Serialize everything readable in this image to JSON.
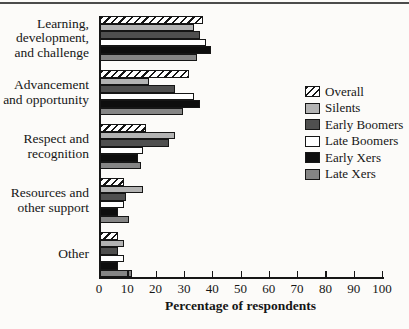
{
  "chart_data": {
    "type": "bar",
    "orientation": "horizontal",
    "title": "",
    "xlabel": "Percentage of respondents",
    "ylabel": "",
    "xlim": [
      0,
      100
    ],
    "xticks": [
      0,
      10,
      20,
      30,
      40,
      50,
      60,
      70,
      80,
      90,
      100
    ],
    "grid": false,
    "legend_position": "right",
    "categories": [
      "Learning, development, and challenge",
      "Advancement and opportunity",
      "Respect and recognition",
      "Resources and other support",
      "Other"
    ],
    "category_label_lines": [
      [
        "Learning,",
        "development,",
        "and challenge"
      ],
      [
        "Advancement",
        "and opportunity"
      ],
      [
        "Respect and",
        "recognition"
      ],
      [
        "Resources and",
        "other support"
      ],
      [
        "Other"
      ]
    ],
    "series": [
      {
        "name": "Overall",
        "fill": "hatch",
        "values": [
          36,
          31,
          16,
          8,
          6
        ]
      },
      {
        "name": "Silents",
        "fill": "#b3b3b3",
        "values": [
          33,
          17,
          26,
          15,
          8
        ]
      },
      {
        "name": "Early Boomers",
        "fill": "#4f4f4f",
        "values": [
          35,
          26,
          24,
          9,
          6
        ]
      },
      {
        "name": "Late Boomers",
        "fill": "#ffffff",
        "values": [
          37,
          33,
          15,
          8,
          8
        ]
      },
      {
        "name": "Early Xers",
        "fill": "#0e0e0e",
        "values": [
          39,
          35,
          13,
          6,
          6
        ]
      },
      {
        "name": "Late Xers",
        "fill": "#858585",
        "values": [
          34,
          29,
          14,
          10,
          11
        ]
      }
    ],
    "colors": {
      "axis": "#161616",
      "text": "#161616",
      "background": "#fcfbf9",
      "top_rule": "#4c4c4c"
    }
  }
}
